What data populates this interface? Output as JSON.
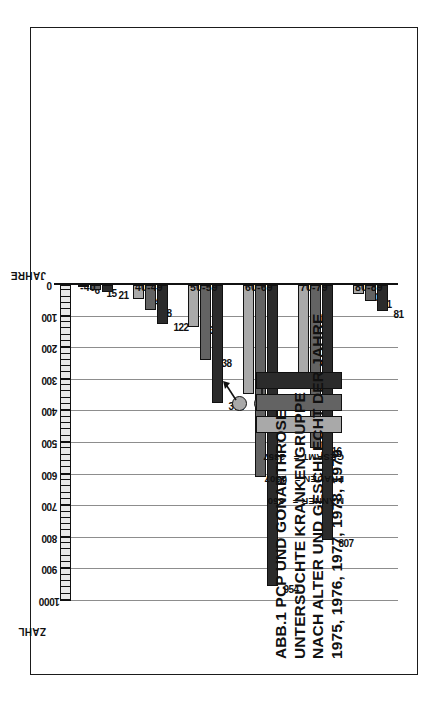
{
  "figure": {
    "label": "ABB.1",
    "title_lines": [
      "PCP UND GONARTHROSE",
      "UNTERSUCHTE KRANKENGRUPPE",
      "NACH ALTER UND GESCHLECHT DER JAHRE",
      "1975, 1976, 1977, 1978, 1979"
    ]
  },
  "legend": {
    "male_symbol": "male-mars-symbol",
    "female_symbol": "female-venus-symbol",
    "entries": [
      {
        "key": "maenner",
        "label": "MÄNNER =",
        "value": "850",
        "color": "#a9a9a9"
      },
      {
        "key": "frauen",
        "label": "FRAUEN =",
        "value": "1507",
        "color": "#636363"
      },
      {
        "key": "gesamt",
        "label": "GESAMT =",
        "value": "2357",
        "color": "#2b2b2b"
      }
    ]
  },
  "axes": {
    "value_axis_title": "ZAHL",
    "category_axis_title": "JAHRE",
    "ticks": [
      "0",
      "100",
      "200",
      "300",
      "400",
      "500",
      "600",
      "700",
      "800",
      "900",
      "1000"
    ]
  },
  "chart_data": {
    "type": "bar",
    "orientation": "horizontal",
    "xlabel": "ZAHL",
    "ylabel": "JAHRE",
    "xlim": [
      0,
      1000
    ],
    "grid": true,
    "legend_position": "center-right",
    "categories": [
      "-40",
      "40-49",
      "50-59",
      "60-69",
      "70-79",
      "80-89"
    ],
    "series": [
      {
        "name": "MÄNNER",
        "color": "#a9a9a9",
        "total": 850,
        "values": [
          6,
          44,
          134,
          345,
          291,
          30
        ]
      },
      {
        "name": "FRAUEN",
        "color": "#636363",
        "total": 1507,
        "values": [
          15,
          78,
          238,
          609,
          516,
          51
        ]
      },
      {
        "name": "GESAMT",
        "color": "#2b2b2b",
        "total": 2357,
        "values": [
          21,
          122,
          372,
          954,
          807,
          81
        ]
      }
    ]
  }
}
